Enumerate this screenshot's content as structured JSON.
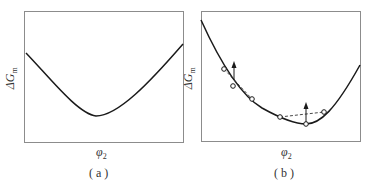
{
  "figure": {
    "panels": [
      {
        "id": "a",
        "caption": "( a )",
        "ylabel_main": "ΔG",
        "ylabel_sub": "m",
        "xlabel_main": "φ",
        "xlabel_sub": "2",
        "description": "Single-well free energy of mixing curve, concave up throughout"
      },
      {
        "id": "b",
        "caption": "( b )",
        "ylabel_main": "ΔG",
        "ylabel_sub": "m",
        "xlabel_main": "φ",
        "xlabel_sub": "2",
        "description": "Free energy curve with tie points and upward arrows showing fluctuation stability"
      }
    ]
  },
  "colors": {
    "curve": "#1a1a1a",
    "frame": "#8c8c8c",
    "dashed": "#333333"
  }
}
